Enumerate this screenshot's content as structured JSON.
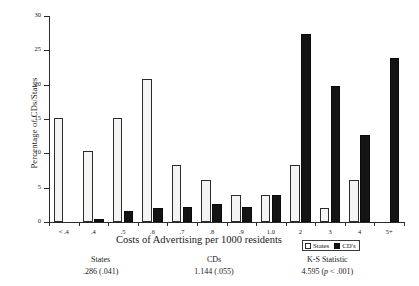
{
  "chart_data": {
    "type": "bar",
    "title": "",
    "xlabel": "Costs of Advertising per 1000 residents",
    "ylabel": "Percentage of CDs/States",
    "categories": [
      "< .4",
      ".4",
      ".5",
      ".6",
      ".7",
      ".8",
      ".9",
      "1.0",
      "2",
      "3",
      "4",
      "5+"
    ],
    "series": [
      {
        "name": "States",
        "values": [
          15.2,
          10.4,
          15.2,
          20.8,
          8.3,
          6.1,
          4.0,
          4.0,
          8.3,
          2.0,
          6.1,
          0
        ]
      },
      {
        "name": "CD's",
        "values": [
          0,
          0.4,
          1.6,
          2.0,
          2.2,
          2.6,
          2.2,
          4.0,
          27.4,
          19.8,
          12.6,
          23.9
        ]
      }
    ],
    "ylim": [
      0,
      30
    ],
    "yticks": [
      0,
      5,
      10,
      15,
      20,
      25,
      30
    ],
    "ytick_labels": [
      "0",
      "5",
      "10",
      "15",
      "20",
      "25",
      "30"
    ],
    "grid": false,
    "legend_position": "bottom-right",
    "colors": {
      "states": "#f4f4f2",
      "cds": "#141414",
      "axis": "#2b2b2b"
    }
  },
  "legend": {
    "items": [
      {
        "label": "States",
        "swatch": "open-square-icon"
      },
      {
        "label": "CD's",
        "swatch": "filled-square-icon"
      }
    ]
  },
  "stats": [
    {
      "name": "States",
      "value": ".286 (.041)"
    },
    {
      "name": "CDs",
      "value": "1.144 (.055)"
    },
    {
      "name": "K-S Statistic",
      "value_prefix": "4.595 (",
      "value_italic": "p",
      "value_suffix": " < .001)"
    }
  ]
}
